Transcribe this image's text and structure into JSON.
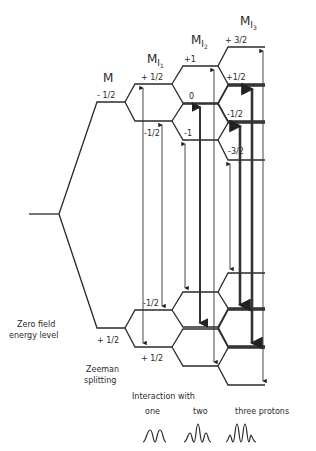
{
  "diagram": {
    "type": "energy-level-diagram",
    "column_headers": {
      "m": "M",
      "mi1": "M",
      "mi1_sub": "I",
      "mi1_subsub": "1",
      "mi2": "M",
      "mi2_sub": "I",
      "mi2_subsub": "2",
      "mi3": "M",
      "mi3_sub": "I",
      "mi3_subsub": "3"
    },
    "upper_labels": {
      "m": "- 1/2",
      "mi1_top": "+ 1/2",
      "mi1_bottom": "-1/2",
      "mi2_top": "+1",
      "mi2_mid": "0",
      "mi2_bottom": "-1",
      "mi3_a": "+ 3/2",
      "mi3_b": "+1/2",
      "mi3_c": "-1/2",
      "mi3_d": "-3/2"
    },
    "lower_labels": {
      "m": "+ 1/2",
      "mi1_top": "-1/2",
      "mi1_bottom": "+ 1/2"
    },
    "left_labels": {
      "zero_field_1": "Zero field",
      "zero_field_2": "energy level",
      "zeeman_1": "Zeeman",
      "zeeman_2": "splitting"
    },
    "bottom": {
      "caption": "Interaction with",
      "one": "one",
      "two": "two",
      "three": "three protons"
    },
    "spectra": [
      {
        "protons": 1,
        "lines": 2,
        "intensities": [
          1,
          1
        ]
      },
      {
        "protons": 2,
        "lines": 3,
        "intensities": [
          1,
          2,
          1
        ]
      },
      {
        "protons": 3,
        "lines": 4,
        "intensities": [
          1,
          3,
          3,
          1
        ]
      }
    ]
  }
}
